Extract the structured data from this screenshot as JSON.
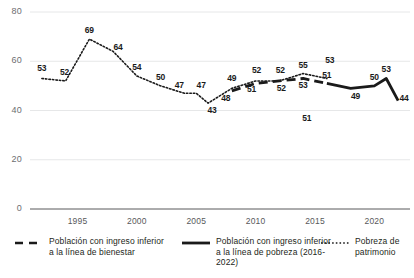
{
  "chart_data": {
    "type": "line",
    "title": "",
    "subtitle": "",
    "xlabel": "",
    "ylabel": "",
    "xlim": [
      1991,
      2023
    ],
    "ylim": [
      0,
      80
    ],
    "yticks": [
      0,
      20,
      40,
      60,
      80
    ],
    "xticks": [
      1995,
      2000,
      2005,
      2010,
      2015,
      2020
    ],
    "grid": true,
    "legend_position": "bottom",
    "series": [
      {
        "name": "Pobreza de patrimonio",
        "style": "dotted",
        "color": "#1a1a1a",
        "points": [
          {
            "x": 1992,
            "y": 53,
            "label": "53"
          },
          {
            "x": 1994,
            "y": 52,
            "label": "52"
          },
          {
            "x": 1996,
            "y": 69,
            "label": "69"
          },
          {
            "x": 1998,
            "y": 64,
            "label": "64"
          },
          {
            "x": 2000,
            "y": 54,
            "label": "54"
          },
          {
            "x": 2002,
            "y": 50,
            "label": "50"
          },
          {
            "x": 2004,
            "y": 47,
            "label": "47"
          },
          {
            "x": 2005,
            "y": 47,
            "label": "47"
          },
          {
            "x": 2006,
            "y": 43,
            "label": "43"
          },
          {
            "x": 2008,
            "y": 49,
            "label": "49"
          },
          {
            "x": 2010,
            "y": 52,
            "label": "52"
          },
          {
            "x": 2012,
            "y": 52,
            "label": "52"
          },
          {
            "x": 2014,
            "y": 55,
            "label": "55"
          },
          {
            "x": 2016,
            "y": 53,
            "label": "53"
          }
        ]
      },
      {
        "name": "Poblacion con ingreso inferior a la linea de bienestar",
        "style": "dashed",
        "color": "#1a1a1a",
        "points": [
          {
            "x": 2008,
            "y": 48,
            "label": "48"
          },
          {
            "x": 2010,
            "y": 51,
            "label": "51"
          },
          {
            "x": 2012,
            "y": 52,
            "label": "52"
          },
          {
            "x": 2014,
            "y": 53,
            "label": "53"
          },
          {
            "x": 2016,
            "y": 51,
            "label": "51"
          }
        ]
      },
      {
        "name": "Poblacion con ingreso inferior a la linea de pobreza (2016-2022)",
        "style": "solid",
        "color": "#1a1a1a",
        "points": [
          {
            "x": 2016,
            "y": 51,
            "label": "51"
          },
          {
            "x": 2018,
            "y": 49,
            "label": "49"
          },
          {
            "x": 2020,
            "y": 50,
            "label": "50"
          },
          {
            "x": 2021,
            "y": 53,
            "label": "53"
          },
          {
            "x": 2022,
            "y": 44,
            "label": "44"
          }
        ]
      }
    ]
  },
  "axis": {
    "y_labels": [
      "80",
      "60",
      "40",
      "20",
      "0"
    ],
    "x_labels": [
      "1995",
      "2000",
      "2005",
      "2010",
      "2015",
      "2020"
    ]
  },
  "legend": {
    "bienestar": "Población con ingreso inferior a la línea de bienestar",
    "pobreza": "Población con ingreso inferior a la línea de pobreza (2016-2022)",
    "patrimonio": "Pobreza de patrimonio"
  }
}
